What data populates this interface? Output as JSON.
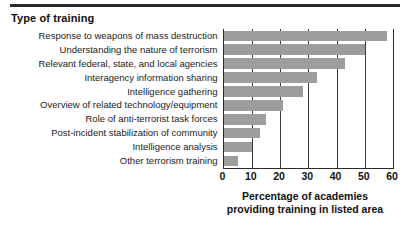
{
  "chart_data": {
    "type": "bar",
    "orientation": "horizontal",
    "title": "Type of training",
    "xlabel": "Percentage of academies providing training in listed area",
    "ylabel": "Type of training",
    "xlabel_lines": [
      "Percentage of academies",
      "providing training in listed area"
    ],
    "xlim": [
      0,
      60
    ],
    "xticks": [
      0,
      10,
      20,
      30,
      40,
      50,
      60
    ],
    "xtick_labels": [
      "0",
      "10",
      "20",
      "30",
      "40",
      "50",
      "60"
    ],
    "grid": true,
    "legend": false,
    "bar_color": "#9d9d9d",
    "axis_color": "#2b2b2b",
    "categories": [
      "Response to weapons of mass destruction",
      "Understanding the nature of terrorism",
      "Relevant federal, state, and local agencies",
      "Interagency information sharing",
      "Intelligence gathering",
      "Overview of related technology/equipment",
      "Role of anti-terrorist task forces",
      "Post-incident stabilization of community",
      "Intelligence analysis",
      "Other terrorism training"
    ],
    "values": [
      58,
      50,
      43,
      33,
      28,
      21,
      15,
      13,
      10,
      5
    ]
  }
}
